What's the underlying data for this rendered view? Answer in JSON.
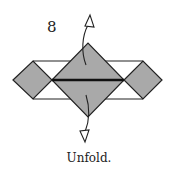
{
  "diagram": {
    "step_number": "8",
    "caption": "Unfold.",
    "colors": {
      "fill": "#a9a9a9",
      "stroke": "#222222",
      "background": "#ffffff"
    },
    "shapes": {
      "center_diamond": "large gray square rotated 45° with horizontal crease",
      "left_diamond": "small gray diamond",
      "right_diamond": "small gray diamond",
      "outline_rectangle": "white rectangle behind diamonds"
    },
    "arrows": [
      {
        "name": "unfold-up-arrow",
        "direction": "up"
      },
      {
        "name": "unfold-down-arrow",
        "direction": "down"
      }
    ]
  }
}
